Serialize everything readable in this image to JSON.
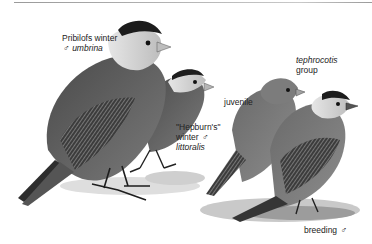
{
  "plate": {
    "subject": "Gray-crowned Rosy-Finch",
    "palette": {
      "ink": "#1e1e1e",
      "dark": "#3a3a3a",
      "mid": "#6e6e6e",
      "light": "#a8a8a8",
      "pale": "#d8d8d8",
      "ground": "#cfcfcf"
    }
  },
  "labels": {
    "pribilofs": {
      "line1": "Pribilofs winter",
      "symbol": "♂",
      "taxon": "umbrina"
    },
    "hepburns": {
      "line1": "\"Hepburn's\"",
      "line2": "winter",
      "symbol": "♂",
      "taxon": "littoralis"
    },
    "juvenile": {
      "text": "juvenile"
    },
    "tephrocotis": {
      "taxon": "tephrocotis",
      "line2": "group"
    },
    "breeding": {
      "text": "breeding",
      "symbol": "♂"
    }
  }
}
